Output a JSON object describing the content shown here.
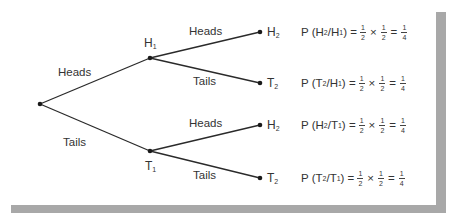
{
  "diagram": {
    "type": "probability-tree",
    "root": {
      "x": 40,
      "y": 104
    },
    "level1": [
      {
        "id": "H1",
        "base": "H",
        "sub": "1",
        "x": 150,
        "y": 58,
        "branch_label": "Heads"
      },
      {
        "id": "T1",
        "base": "T",
        "sub": "1",
        "x": 150,
        "y": 151,
        "branch_label": "Tails"
      }
    ],
    "level2": [
      {
        "id": "H2a",
        "parent": "H1",
        "base": "H",
        "sub": "2",
        "x": 260,
        "y": 32,
        "branch_label": "Heads"
      },
      {
        "id": "T2a",
        "parent": "H1",
        "base": "T",
        "sub": "2",
        "x": 260,
        "y": 83,
        "branch_label": "Tails"
      },
      {
        "id": "H2b",
        "parent": "T1",
        "base": "H",
        "sub": "2",
        "x": 260,
        "y": 125,
        "branch_label": "Heads"
      },
      {
        "id": "T2b",
        "parent": "T1",
        "base": "T",
        "sub": "2",
        "x": 260,
        "y": 178,
        "branch_label": "Tails"
      }
    ],
    "equations": [
      {
        "prefix": "P (",
        "a_base": "H",
        "a_sub": "2",
        "sep": "/ ",
        "b_base": "H",
        "b_sub": "1",
        "suffix": ") =",
        "f1": {
          "n": "1",
          "d": "2"
        },
        "times": "×",
        "f2": {
          "n": "1",
          "d": "2"
        },
        "eq": "=",
        "result": {
          "n": "1",
          "d": "4"
        }
      },
      {
        "prefix": "P (",
        "a_base": "T",
        "a_sub": "2",
        "sep": "/ ",
        "b_base": "H",
        "b_sub": "1",
        "suffix": ") =",
        "f1": {
          "n": "1",
          "d": "2"
        },
        "times": "×",
        "f2": {
          "n": "1",
          "d": "2"
        },
        "eq": "=",
        "result": {
          "n": "1",
          "d": "4"
        }
      },
      {
        "prefix": "P (",
        "a_base": "H",
        "a_sub": "2",
        "sep": "/ ",
        "b_base": "T",
        "b_sub": "1",
        "suffix": ") =",
        "f1": {
          "n": "1",
          "d": "2"
        },
        "times": "×",
        "f2": {
          "n": "1",
          "d": "2"
        },
        "eq": "=",
        "result": {
          "n": "1",
          "d": "4"
        }
      },
      {
        "prefix": "P (",
        "a_base": "T",
        "a_sub": "2",
        "sep": "/ ",
        "b_base": "T",
        "b_sub": "1",
        "suffix": ") =",
        "f1": {
          "n": "1",
          "d": "2"
        },
        "times": "×",
        "f2": {
          "n": "1",
          "d": "2"
        },
        "eq": "=",
        "result": {
          "n": "1",
          "d": "4"
        }
      }
    ]
  },
  "colors": {
    "line": "#2a2a2a",
    "text": "#333333",
    "shadow": "#a8a8a8",
    "background": "#ffffff"
  }
}
